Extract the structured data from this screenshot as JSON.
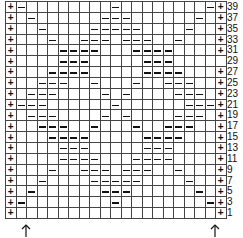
{
  "chart": {
    "columns": 21,
    "symbols": {
      "plus": "+",
      "purl": "–",
      "empty": ""
    },
    "rows": [
      {
        "label": "39",
        "cells": "+-........-........-+"
      },
      {
        "label": "37",
        "cells": "+.-......---......-.+"
      },
      {
        "label": "35",
        "cells": "+..-....-----....-..+"
      },
      {
        "label": "33",
        "cells": "+...-..---.---..-...+"
      },
      {
        "label": "31",
        "cells": "+....----...----....+"
      },
      {
        "label": "29",
        "cells": "+....---.....---.....+"
      },
      {
        "label": "27",
        "cells": "+...----.....----...+"
      },
      {
        "label": "25",
        "cells": "+..---..-...-..---..+"
      },
      {
        "label": "23",
        "cells": "+.---....-.-....---.+"
      },
      {
        "label": "21",
        "cells": "+---......-......---+"
      },
      {
        "label": "19",
        "cells": "+.---....-.-....---.+"
      },
      {
        "label": "17",
        "cells": "+..---..-...-..---..+"
      },
      {
        "label": "15",
        "cells": "+...----.....----...+"
      },
      {
        "label": "13",
        "cells": "+....---.....---....+"
      },
      {
        "label": "11",
        "cells": "+....----...----....+"
      },
      {
        "label": "9",
        "cells": "+...-..---.---..-...+"
      },
      {
        "label": "7",
        "cells": "+..-....-----....-..+"
      },
      {
        "label": "5",
        "cells": "+.-......---......-.+"
      },
      {
        "label": "3",
        "cells": "+-........-........-+"
      },
      {
        "label": "1",
        "cells": "+...................+"
      }
    ],
    "arrows": [
      {
        "icon": "up-arrow-icon",
        "glyph": "↑",
        "position": "left"
      },
      {
        "icon": "up-arrow-icon",
        "glyph": "↑",
        "position": "right"
      }
    ]
  }
}
